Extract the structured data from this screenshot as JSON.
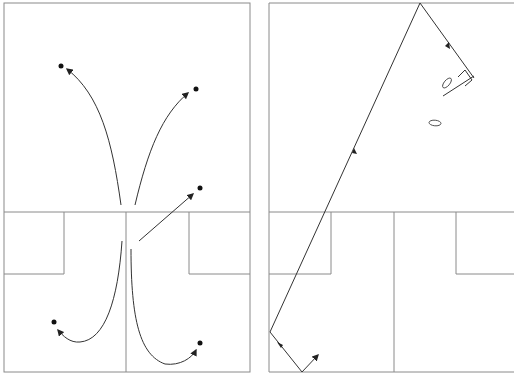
{
  "figure": {
    "width": 514,
    "height": 382,
    "stroke_color": "#3a3a3a",
    "border_color": "#8a8a8a",
    "background": "#ffffff"
  },
  "panels": [
    {
      "id": "left",
      "description": "Court diagram with five curved/straight movement arrows from a central origin to dots",
      "dots": [
        [
          61,
          66
        ],
        [
          196,
          89
        ],
        [
          200,
          188
        ],
        [
          54,
          322
        ],
        [
          200,
          343
        ]
      ],
      "arrows": [
        {
          "from": [
            121,
            205
          ],
          "to": [
            66,
            69
          ],
          "type": "curve"
        },
        {
          "from": [
            131,
            205
          ],
          "to": [
            188,
            93
          ],
          "type": "curve"
        },
        {
          "from": [
            139,
            241
          ],
          "to": [
            193,
            193
          ],
          "type": "straight"
        },
        {
          "from": [
            122,
            241
          ],
          "to": [
            58,
            330
          ],
          "type": "curve"
        },
        {
          "from": [
            131,
            249
          ],
          "to": [
            196,
            350
          ],
          "type": "curve"
        }
      ]
    },
    {
      "id": "right",
      "description": "Court diagram with a bouncing path trajectory and two footprint shapes",
      "path_points": [
        [
          302,
          372
        ],
        [
          270,
          332
        ],
        [
          420,
          3
        ],
        [
          474,
          78
        ]
      ],
      "arrow_markers": 4,
      "footprints": 2
    }
  ]
}
